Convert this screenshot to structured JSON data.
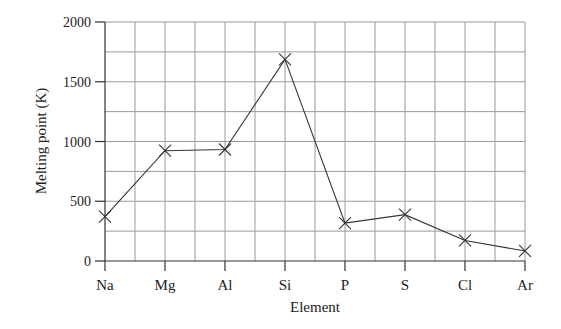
{
  "chart_data": {
    "type": "line",
    "title": "",
    "xlabel": "Element",
    "ylabel": "Melting point (K)",
    "categories": [
      "Na",
      "Mg",
      "Al",
      "Si",
      "P",
      "S",
      "Cl",
      "Ar"
    ],
    "series": [
      {
        "name": "Melting point",
        "values": [
          371,
          923,
          933,
          1687,
          317,
          388,
          172,
          84
        ],
        "marker": "x"
      }
    ],
    "ylim": [
      0,
      2000
    ],
    "yticks": [
      0,
      500,
      1000,
      1500,
      2000
    ],
    "ytick_labels": [
      "0",
      "500",
      "1000",
      "1500",
      "2000"
    ],
    "grid": true,
    "grid_y_step": 250,
    "grid_x_step": 0.5,
    "legend": null
  },
  "colors": {
    "line": "#333333",
    "grid": "#9a9a9a",
    "axis": "#333333"
  }
}
